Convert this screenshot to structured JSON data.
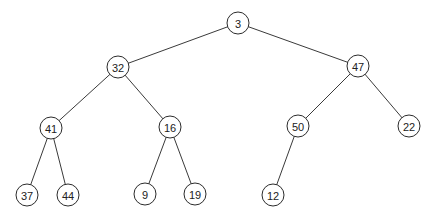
{
  "diagram": {
    "type": "binary-tree",
    "node_radius": 11,
    "colors": {
      "background": "#ffffff",
      "edge": "#3a3a3a",
      "node_stroke": "#2b2b2b",
      "node_fill": "#ffffff",
      "label": "#222222"
    },
    "nodes": [
      {
        "id": "n3",
        "label": "3",
        "x": 238,
        "y": 23
      },
      {
        "id": "n32",
        "label": "32",
        "x": 118,
        "y": 67
      },
      {
        "id": "n47",
        "label": "47",
        "x": 358,
        "y": 66
      },
      {
        "id": "n41",
        "label": "41",
        "x": 51,
        "y": 128
      },
      {
        "id": "n16",
        "label": "16",
        "x": 170,
        "y": 127
      },
      {
        "id": "n50",
        "label": "50",
        "x": 298,
        "y": 126
      },
      {
        "id": "n22",
        "label": "22",
        "x": 409,
        "y": 126
      },
      {
        "id": "n37",
        "label": "37",
        "x": 27,
        "y": 195
      },
      {
        "id": "n44",
        "label": "44",
        "x": 68,
        "y": 195
      },
      {
        "id": "n9",
        "label": "9",
        "x": 145,
        "y": 194
      },
      {
        "id": "n19",
        "label": "19",
        "x": 195,
        "y": 194
      },
      {
        "id": "n12",
        "label": "12",
        "x": 273,
        "y": 195
      }
    ],
    "edges": [
      {
        "from": "n3",
        "to": "n32"
      },
      {
        "from": "n3",
        "to": "n47"
      },
      {
        "from": "n32",
        "to": "n41"
      },
      {
        "from": "n32",
        "to": "n16"
      },
      {
        "from": "n47",
        "to": "n50"
      },
      {
        "from": "n47",
        "to": "n22"
      },
      {
        "from": "n41",
        "to": "n37"
      },
      {
        "from": "n41",
        "to": "n44"
      },
      {
        "from": "n16",
        "to": "n9"
      },
      {
        "from": "n16",
        "to": "n19"
      },
      {
        "from": "n50",
        "to": "n12"
      }
    ]
  }
}
